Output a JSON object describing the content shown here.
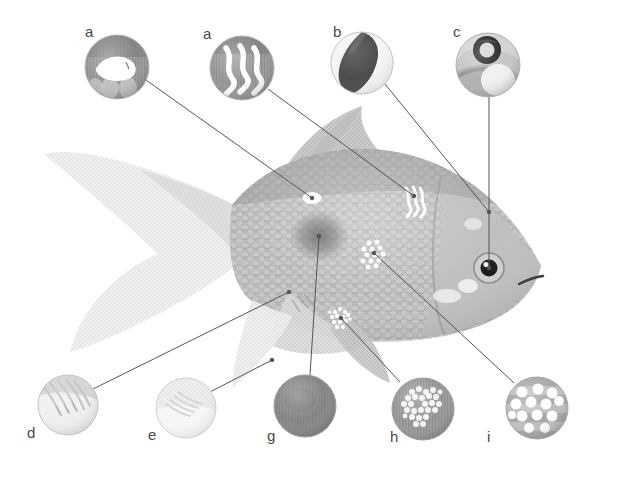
{
  "figure": {
    "background_color": "#ffffff",
    "width": 622,
    "height": 478,
    "line_color": "#555555",
    "label_color": "#4a4a4a",
    "body_color": "#b4b4b4",
    "fin_color": "#d8d8d8",
    "lesion_color": "#ffffff",
    "dark_patch_color": "#7d7d7d"
  },
  "callouts": [
    {
      "id": "a1",
      "label": "a",
      "label_x": 85,
      "label_y": 31,
      "circle_cx": 117,
      "circle_cy": 67,
      "circle_r": 32,
      "inset_type": "ulcer-open-lesion",
      "inset_bg": "#9a9a9a",
      "leader_from_x": 146,
      "leader_from_y": 80,
      "leader_to_x": 312,
      "leader_to_y": 198,
      "target": "body-white-oval-lesion"
    },
    {
      "id": "a2",
      "label": "a",
      "label_x": 203,
      "label_y": 33,
      "circle_cx": 242,
      "circle_cy": 68,
      "circle_r": 32,
      "inset_type": "wavy-white-streaks",
      "inset_bg": "#989898",
      "leader_from_x": 268,
      "leader_from_y": 89,
      "leader_to_x": 414,
      "leader_to_y": 196,
      "target": "body-wavy-streak-lesion"
    },
    {
      "id": "b",
      "label": "b",
      "label_x": 333,
      "label_y": 31,
      "circle_cx": 362,
      "circle_cy": 63,
      "circle_r": 31,
      "inset_type": "dark-crescent-fin",
      "inset_bg": "#f2f2f2",
      "leader_from_x": 385,
      "leader_from_y": 84,
      "leader_to_x": 489,
      "leader_to_y": 212,
      "target": "dorsal-fin-edge"
    },
    {
      "id": "c",
      "label": "c",
      "label_x": 453,
      "label_y": 31,
      "circle_cx": 488,
      "circle_cy": 65,
      "circle_r": 32,
      "inset_type": "eye-with-lesion",
      "inset_bg": "#c8c8c8",
      "leader_from_x": 489,
      "leader_from_y": 97,
      "leader_to_x": 489,
      "leader_to_y": 268,
      "target": "eye"
    },
    {
      "id": "d",
      "label": "d",
      "label_x": 27,
      "label_y": 432,
      "circle_cx": 68,
      "circle_cy": 405,
      "circle_r": 30,
      "inset_type": "frayed-fin-rays",
      "inset_bg": "#e6e6e6",
      "leader_from_x": 93,
      "leader_from_y": 389,
      "leader_to_x": 289,
      "leader_to_y": 292,
      "target": "pectoral-fin-fray"
    },
    {
      "id": "e",
      "label": "e",
      "label_x": 148,
      "label_y": 434,
      "circle_cx": 186,
      "circle_cy": 408,
      "circle_r": 30,
      "inset_type": "pale-fin-rays",
      "inset_bg": "#f0f0f0",
      "leader_from_x": 210,
      "leader_from_y": 392,
      "leader_to_x": 272,
      "leader_to_y": 360,
      "target": "pelvic-fin"
    },
    {
      "id": "g",
      "label": "g",
      "label_x": 267,
      "label_y": 435,
      "circle_cx": 305,
      "circle_cy": 406,
      "circle_r": 31,
      "inset_type": "dark-diffuse-patch",
      "inset_bg": "#969696",
      "leader_from_x": 310,
      "leader_from_y": 375,
      "leader_to_x": 319,
      "leader_to_y": 236,
      "target": "body-dark-patch"
    },
    {
      "id": "h",
      "label": "h",
      "label_x": 390,
      "label_y": 436,
      "circle_cx": 423,
      "circle_cy": 409,
      "circle_r": 31,
      "inset_type": "granular-white-cluster",
      "inset_bg": "#a0a0a0",
      "leader_from_x": 400,
      "leader_from_y": 382,
      "leader_to_x": 341,
      "leader_to_y": 318,
      "target": "anal-fin-granular-patch"
    },
    {
      "id": "i",
      "label": "i",
      "label_x": 487,
      "label_y": 436,
      "circle_cx": 537,
      "circle_cy": 408,
      "circle_r": 31,
      "inset_type": "white-spot-disease",
      "inset_bg": "#bcbcbc",
      "leader_from_x": 514,
      "leader_from_y": 383,
      "leader_to_x": 374,
      "leader_to_y": 253,
      "target": "body-white-spots"
    }
  ],
  "fish": {
    "name": "goldfish-illustration",
    "eye": {
      "cx": 489,
      "cy": 268,
      "iris_r": 15,
      "pupil_r": 8.5
    },
    "lesions": [
      {
        "name": "white-oval-lesion",
        "cx": 312,
        "cy": 198,
        "rx": 9,
        "ry": 5.5
      },
      {
        "name": "wavy-streak-lesion",
        "cx": 414,
        "cy": 200
      },
      {
        "name": "white-spot-cluster",
        "cx": 374,
        "cy": 253
      },
      {
        "name": "granular-patch",
        "cx": 341,
        "cy": 318
      },
      {
        "name": "dark-patch",
        "cx": 319,
        "cy": 236,
        "rx": 28,
        "ry": 24
      }
    ]
  }
}
